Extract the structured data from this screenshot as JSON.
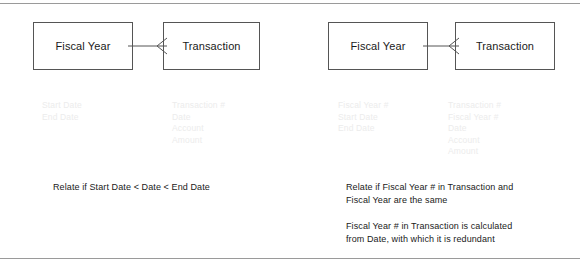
{
  "figure": {
    "background": "#ffffff",
    "frame_color": "#9a9a9a",
    "box_border_color": "#555555",
    "entity_text_color": "#1a1a1a",
    "attribute_text_color": "#ececec",
    "caption_text_color": "#1a1a1a"
  },
  "panels": [
    {
      "id": "date-range-relationship",
      "parent_entity": {
        "name": "Fiscal Year",
        "attributes": [
          "Start Date",
          "End Date"
        ]
      },
      "child_entity": {
        "name": "Transaction",
        "attributes": [
          "Transaction #",
          "Date",
          "Account",
          "Amount"
        ]
      },
      "relationship": {
        "parent_cardinality": "one",
        "child_cardinality": "many",
        "notation": "crows-foot"
      },
      "captions": [
        {
          "lines": [
            "Relate if Start Date < Date < End Date"
          ]
        }
      ]
    },
    {
      "id": "foreign-key-relationship",
      "parent_entity": {
        "name": "Fiscal Year",
        "attributes": [
          "Fiscal Year #",
          "Start Date",
          "End Date"
        ]
      },
      "child_entity": {
        "name": "Transaction",
        "attributes": [
          "Transaction #",
          "Fiscal Year #",
          "Date",
          "Account",
          "Amount"
        ]
      },
      "relationship": {
        "parent_cardinality": "one",
        "child_cardinality": "many",
        "notation": "crows-foot"
      },
      "captions": [
        {
          "lines": [
            "Relate if Fiscal Year # in Transaction and",
            "Fiscal Year are the same"
          ]
        },
        {
          "lines": [
            "Fiscal Year # in Transaction is calculated",
            "from Date, with which it is redundant"
          ]
        }
      ]
    }
  ]
}
